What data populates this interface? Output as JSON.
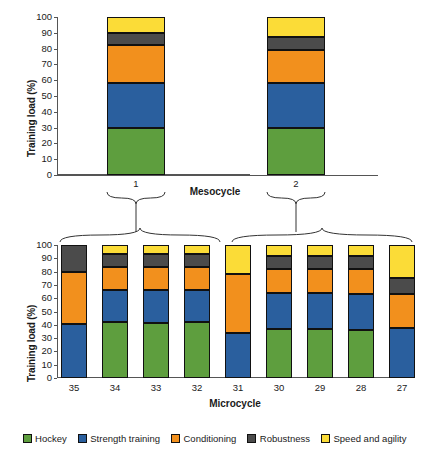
{
  "chart_data": [
    {
      "type": "bar",
      "id": "mesocycle-chart",
      "stacked": true,
      "percent": true,
      "title": "",
      "xlabel": "Mesocycle",
      "ylabel": "Training load (%)",
      "ylim": [
        0,
        100
      ],
      "yticks": [
        0,
        10,
        20,
        30,
        40,
        50,
        60,
        70,
        80,
        90,
        100
      ],
      "grid": false,
      "legend_position": "bottom",
      "categories": [
        "1",
        "2"
      ],
      "series": [
        {
          "name": "Hockey",
          "color": "#5e9e3e",
          "values": [
            30,
            30
          ]
        },
        {
          "name": "Strength training",
          "color": "#2a5f9e",
          "values": [
            28,
            28
          ]
        },
        {
          "name": "Conditioning",
          "color": "#f2901d",
          "values": [
            24,
            21
          ]
        },
        {
          "name": "Robustness",
          "color": "#4b4b4b",
          "values": [
            8,
            8.5
          ]
        },
        {
          "name": "Speed and agility",
          "color": "#fbdc37",
          "values": [
            10,
            12.5
          ]
        }
      ]
    },
    {
      "type": "bar",
      "id": "microcycle-chart",
      "stacked": true,
      "percent": true,
      "title": "",
      "xlabel": "Microcycle",
      "ylabel": "Training load (%)",
      "ylim": [
        0,
        100
      ],
      "yticks": [
        0,
        10,
        20,
        30,
        40,
        50,
        60,
        70,
        80,
        90,
        100
      ],
      "grid": false,
      "legend_position": "bottom",
      "categories": [
        "35",
        "34",
        "33",
        "32",
        "31",
        "30",
        "29",
        "28",
        "27"
      ],
      "series": [
        {
          "name": "Hockey",
          "color": "#5e9e3e",
          "values": [
            0,
            42,
            41,
            42,
            0,
            36.5,
            36.5,
            36,
            0
          ]
        },
        {
          "name": "Strength training",
          "color": "#2a5f9e",
          "values": [
            40.5,
            24.5,
            25.5,
            24.5,
            33.5,
            27.5,
            27.5,
            27.5,
            37.5
          ]
        },
        {
          "name": "Conditioning",
          "color": "#f2901d",
          "values": [
            39.5,
            17,
            17,
            17,
            44.5,
            18,
            18,
            18.5,
            25.5
          ]
        },
        {
          "name": "Robustness",
          "color": "#4b4b4b",
          "values": [
            20,
            9.5,
            9.5,
            9.5,
            0,
            10,
            10,
            10,
            12
          ]
        },
        {
          "name": "Speed and agility",
          "color": "#fbdc37",
          "values": [
            0,
            7,
            7,
            7,
            22,
            8,
            8,
            8,
            25
          ]
        }
      ]
    }
  ],
  "legend": {
    "items": [
      {
        "label": "Hockey",
        "color": "#5e9e3e"
      },
      {
        "label": "Strength training",
        "color": "#2a5f9e"
      },
      {
        "label": "Conditioning",
        "color": "#f2901d"
      },
      {
        "label": "Robustness",
        "color": "#4b4b4b"
      },
      {
        "label": "Speed and agility",
        "color": "#fbdc37"
      }
    ]
  },
  "mesocycle": {
    "ylabel": "Training load (%)",
    "xlabel": "Mesocycle",
    "xticklabels": [
      "1",
      "2"
    ]
  },
  "microcycle": {
    "ylabel": "Training load (%)",
    "xlabel": "Microcycle",
    "xticklabels": [
      "35",
      "34",
      "33",
      "32",
      "31",
      "30",
      "29",
      "28",
      "27"
    ]
  }
}
